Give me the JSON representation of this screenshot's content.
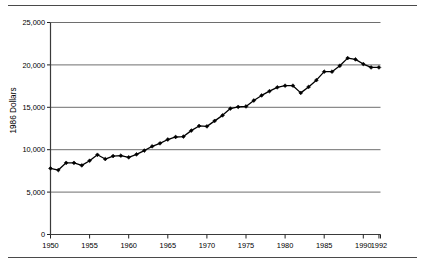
{
  "figure": {
    "top_rule": "horizontal-rule",
    "bottom_rule": "horizontal-rule"
  },
  "chart_data": {
    "type": "line",
    "title": "",
    "subtitle": "",
    "xlabel": "",
    "ylabel": "1986 Dollars",
    "xlim": [
      1950,
      1992
    ],
    "ylim": [
      0,
      25000
    ],
    "grid": true,
    "grid_axis": "y",
    "legend": false,
    "legend_position": "none",
    "line_color": "#000000",
    "marker": "diamond",
    "marker_color": "#000000",
    "y_ticks": [
      0,
      5000,
      10000,
      15000,
      20000,
      25000
    ],
    "y_tick_labels": [
      "0",
      "5,000",
      "10,000",
      "15,000",
      "20,000",
      "25,000"
    ],
    "x_ticks": [
      1950,
      1955,
      1960,
      1965,
      1970,
      1975,
      1980,
      1985,
      1990,
      1992
    ],
    "x_tick_labels": [
      "1950",
      "1955",
      "1960",
      "1965",
      "1970",
      "1975",
      "1980",
      "1985",
      "1990",
      "1992"
    ],
    "x": [
      1950,
      1951,
      1952,
      1953,
      1954,
      1955,
      1956,
      1957,
      1958,
      1959,
      1960,
      1961,
      1962,
      1963,
      1964,
      1965,
      1966,
      1967,
      1968,
      1969,
      1970,
      1971,
      1972,
      1973,
      1974,
      1975,
      1976,
      1977,
      1978,
      1979,
      1980,
      1981,
      1982,
      1983,
      1984,
      1985,
      1986,
      1987,
      1988,
      1989,
      1990,
      1991,
      1992
    ],
    "values": [
      7800,
      7600,
      8450,
      8450,
      8150,
      8700,
      9400,
      8900,
      9250,
      9300,
      9100,
      9450,
      9900,
      10400,
      10750,
      11200,
      11500,
      11550,
      12250,
      12800,
      12750,
      13400,
      14050,
      14850,
      15050,
      15100,
      15800,
      16400,
      16900,
      17350,
      17550,
      17550,
      16700,
      17400,
      18200,
      19200,
      19200,
      19900,
      20800,
      20650,
      20100,
      19700,
      19700
    ],
    "series": [
      {
        "name": "1986 Dollars",
        "values": [
          7800,
          7600,
          8450,
          8450,
          8150,
          8700,
          9400,
          8900,
          9250,
          9300,
          9100,
          9450,
          9900,
          10400,
          10750,
          11200,
          11500,
          11550,
          12250,
          12800,
          12750,
          13400,
          14050,
          14850,
          15050,
          15100,
          15800,
          16400,
          16900,
          17350,
          17550,
          17550,
          16700,
          17400,
          18200,
          19200,
          19200,
          19900,
          20800,
          20650,
          20100,
          19700,
          19700
        ]
      }
    ]
  }
}
